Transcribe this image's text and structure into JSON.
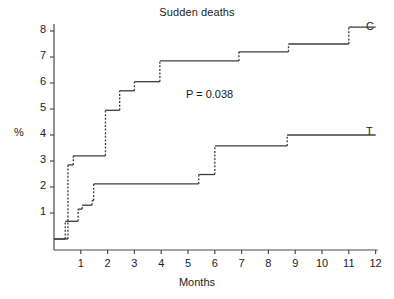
{
  "chart_data": {
    "type": "line",
    "title": "Sudden deaths",
    "xlabel": "Months",
    "ylabel": "%",
    "xlim": [
      0,
      12
    ],
    "ylim": [
      0,
      8.4
    ],
    "grid": false,
    "legend_position": "right-inline",
    "annotations": [
      {
        "text": "P = 0.038",
        "x": 6.0,
        "y": 5.8
      }
    ],
    "xticks": [
      1,
      2,
      3,
      4,
      5,
      6,
      7,
      8,
      9,
      10,
      11,
      12
    ],
    "yticks": [
      1,
      2,
      3,
      4,
      5,
      6,
      7,
      8
    ],
    "series": [
      {
        "name": "C",
        "label": "C",
        "style": "step",
        "color": "#3c3c3c",
        "points": [
          {
            "x": 0.0,
            "y": 0.0
          },
          {
            "x": 0.52,
            "y": 0.0
          },
          {
            "x": 0.52,
            "y": 2.85
          },
          {
            "x": 0.72,
            "y": 2.85
          },
          {
            "x": 0.72,
            "y": 3.2
          },
          {
            "x": 1.92,
            "y": 3.2
          },
          {
            "x": 1.92,
            "y": 4.95
          },
          {
            "x": 2.45,
            "y": 4.95
          },
          {
            "x": 2.45,
            "y": 5.7
          },
          {
            "x": 3.0,
            "y": 5.7
          },
          {
            "x": 3.0,
            "y": 6.05
          },
          {
            "x": 3.95,
            "y": 6.05
          },
          {
            "x": 3.95,
            "y": 6.85
          },
          {
            "x": 6.9,
            "y": 6.85
          },
          {
            "x": 6.9,
            "y": 7.2
          },
          {
            "x": 8.75,
            "y": 7.2
          },
          {
            "x": 8.75,
            "y": 7.5
          },
          {
            "x": 11.0,
            "y": 7.5
          },
          {
            "x": 11.0,
            "y": 8.15
          },
          {
            "x": 12.0,
            "y": 8.15
          }
        ]
      },
      {
        "name": "T",
        "label": "T",
        "style": "step",
        "color": "#3c3c3c",
        "points": [
          {
            "x": 0.0,
            "y": 0.0
          },
          {
            "x": 0.42,
            "y": 0.0
          },
          {
            "x": 0.42,
            "y": 0.68
          },
          {
            "x": 0.9,
            "y": 0.68
          },
          {
            "x": 0.9,
            "y": 1.15
          },
          {
            "x": 1.05,
            "y": 1.15
          },
          {
            "x": 1.05,
            "y": 1.3
          },
          {
            "x": 1.42,
            "y": 1.3
          },
          {
            "x": 1.42,
            "y": 1.48
          },
          {
            "x": 1.48,
            "y": 1.48
          },
          {
            "x": 1.48,
            "y": 2.12
          },
          {
            "x": 5.4,
            "y": 2.12
          },
          {
            "x": 5.4,
            "y": 2.48
          },
          {
            "x": 6.0,
            "y": 2.48
          },
          {
            "x": 6.0,
            "y": 3.58
          },
          {
            "x": 8.7,
            "y": 3.58
          },
          {
            "x": 8.7,
            "y": 4.0
          },
          {
            "x": 12.0,
            "y": 4.0
          }
        ]
      }
    ]
  },
  "axes": {
    "x_tick_labels": [
      "1",
      "2",
      "3",
      "4",
      "5",
      "6",
      "7",
      "8",
      "9",
      "10",
      "11",
      "12"
    ],
    "y_tick_labels": [
      "1",
      "2",
      "3",
      "4",
      "5",
      "6",
      "7",
      "8"
    ]
  },
  "labels": {
    "title": "Sudden deaths",
    "xlabel": "Months",
    "ylabel": "%",
    "pvalue": "P = 0.038",
    "series_c": "C",
    "series_t": "T"
  },
  "colors": {
    "background": "#ffffff",
    "axis": "#4a4a4a",
    "curve": "#3c3c3c",
    "text": "#1a1a1a"
  }
}
